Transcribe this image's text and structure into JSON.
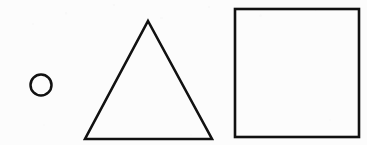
{
  "canvas": {
    "width": 367,
    "height": 145,
    "background_color": "#fcfcfc",
    "stroke_color": "#111111",
    "description": "Three hand-drawn black outline geometric shapes on a scanned white page: a small circle, a triangle, and a square."
  },
  "shapes": [
    {
      "name": "circle",
      "label": "Circle",
      "stroke_color": "#111111",
      "stroke_width": 2.5,
      "fill": "none",
      "center_x": 41,
      "center_y": 85,
      "radius": 10.5
    },
    {
      "name": "triangle",
      "label": "Triangle",
      "stroke_color": "#111111",
      "stroke_width": 2.6,
      "fill": "none",
      "points": "148,21 212,139 85,139",
      "apex_x": 148,
      "apex_y": 21,
      "base_left_x": 85,
      "base_right_x": 212,
      "base_y": 139
    },
    {
      "name": "square",
      "label": "Square",
      "stroke_color": "#111111",
      "stroke_width": 2.6,
      "fill": "none",
      "x": 235,
      "y": 9,
      "width": 124,
      "height": 128
    }
  ]
}
